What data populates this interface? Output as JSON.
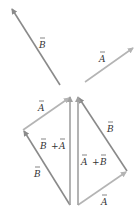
{
  "colors": {
    "vector_a": "#b4b4b4",
    "vector_b": "#8a8a8a",
    "vector_sum": "#a0a0a0",
    "label": "#333333"
  },
  "top": {
    "vector_b_label": "B",
    "vector_a_label": "A"
  },
  "left_triangle": {
    "vector_b_label": "B",
    "vector_a_label": "A",
    "sum_label_first": "B",
    "sum_plus": "+",
    "sum_label_second": "A"
  },
  "right_triangle": {
    "vector_a_label": "A",
    "vector_b_label": "B",
    "sum_label_first": "A",
    "sum_plus": "+",
    "sum_label_second": "B"
  }
}
